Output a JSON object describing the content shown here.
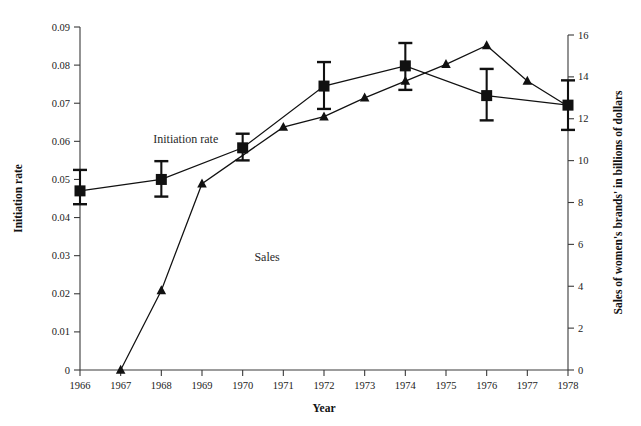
{
  "chart_data": {
    "type": "line",
    "title": "",
    "subtitle": "",
    "xlabel": "Year",
    "ylabel": "Initiation rate",
    "y2label": "Sales of women's brands' in billions of dollars",
    "x": [
      1966,
      1967,
      1968,
      1969,
      1970,
      1971,
      1972,
      1973,
      1974,
      1975,
      1976,
      1977,
      1978
    ],
    "xticklabels": [
      "1966",
      "1967",
      "1968",
      "1969",
      "1970",
      "1971",
      "1972",
      "1973",
      "1974",
      "1975",
      "1976",
      "1977",
      "1978"
    ],
    "xlim": [
      1966,
      1978
    ],
    "ylim": [
      0,
      0.09
    ],
    "yticks": [
      0,
      0.01,
      0.02,
      0.03,
      0.04,
      0.05,
      0.06,
      0.07,
      0.08,
      0.09
    ],
    "yticklabels": [
      "0",
      "0.01",
      "0.02",
      "0.03",
      "0.04",
      "0.05",
      "0.06",
      "0.07",
      "0.08",
      "0.09"
    ],
    "y2lim": [
      0,
      16
    ],
    "y2ticks": [
      0,
      2,
      4,
      6,
      8,
      10,
      12,
      14,
      16
    ],
    "y2ticklabels": [
      "0",
      "2",
      "4",
      "6",
      "8",
      "10",
      "12",
      "14",
      "16"
    ],
    "grid": false,
    "legend_position": "inline-annotations",
    "annotations": [
      {
        "text": "Initiation rate",
        "x": 1968.6,
        "y": 0.0595,
        "axis": "left"
      },
      {
        "text": "Sales",
        "x": 1970.6,
        "y": 5.2,
        "axis": "right"
      }
    ],
    "series": [
      {
        "name": "Initiation rate",
        "axis": "left",
        "marker": "square",
        "x": [
          1966,
          1968,
          1970,
          1972,
          1974,
          1976,
          1978
        ],
        "values": [
          0.047,
          0.05,
          0.0583,
          0.0745,
          0.0798,
          0.072,
          0.0695
        ],
        "error_low": [
          0.0435,
          0.0455,
          0.055,
          0.0685,
          0.0735,
          0.0655,
          0.063
        ],
        "error_high": [
          0.0525,
          0.0548,
          0.062,
          0.0808,
          0.0858,
          0.079,
          0.076
        ]
      },
      {
        "name": "Sales",
        "axis": "right",
        "marker": "triangle",
        "x": [
          1967,
          1968,
          1969,
          1971,
          1972,
          1973,
          1974,
          1975,
          1976,
          1977,
          1978
        ],
        "values": [
          0.0,
          3.8,
          8.9,
          11.6,
          12.1,
          13.0,
          13.8,
          14.6,
          15.5,
          13.8,
          12.6
        ]
      }
    ]
  },
  "colors": {
    "ink": "#111111",
    "axis": "#3a3a3a",
    "background": "#ffffff",
    "label": "#2a2a2a"
  }
}
